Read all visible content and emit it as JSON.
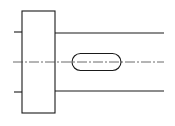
{
  "diagram": {
    "type": "technical-drawing",
    "subject": "shaft-with-flange-and-keyway",
    "colors": {
      "line": "#1a1a1a",
      "centerline": "#444444",
      "background": "#ffffff"
    },
    "flange": {
      "x": 22,
      "y": 11,
      "width": 33,
      "height": 102
    },
    "left_ticks": [
      {
        "x1": 14,
        "y1": 32,
        "x2": 22,
        "y2": 32
      },
      {
        "x1": 14,
        "y1": 92,
        "x2": 22,
        "y2": 92
      }
    ],
    "shaft_lines": [
      {
        "x1": 55,
        "y1": 33,
        "x2": 164,
        "y2": 33
      },
      {
        "x1": 55,
        "y1": 91,
        "x2": 164,
        "y2": 91
      }
    ],
    "centerline": {
      "x1": 13,
      "y1": 62,
      "x2": 164,
      "y2": 62,
      "dash": "10 2 2 2"
    },
    "keyway_slot": {
      "x": 72,
      "y": 53.5,
      "width": 49,
      "height": 17,
      "rx": 8.5
    }
  }
}
